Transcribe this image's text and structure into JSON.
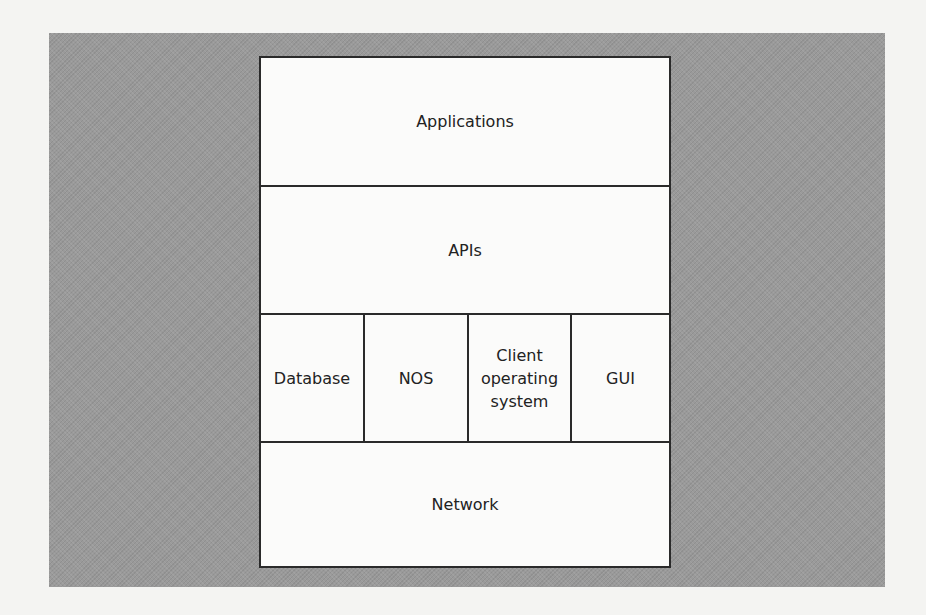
{
  "diagram": {
    "title": "",
    "layers": [
      {
        "id": "applications",
        "label": "Applications"
      },
      {
        "id": "apis",
        "label": "APIs"
      },
      {
        "id": "middle",
        "components": [
          {
            "id": "database",
            "label": "Database"
          },
          {
            "id": "nos",
            "label": "NOS"
          },
          {
            "id": "client-os",
            "label": "Client\noperating\nsystem"
          },
          {
            "id": "gui",
            "label": "GUI"
          }
        ]
      },
      {
        "id": "network",
        "label": "Network"
      }
    ],
    "colors": {
      "background": "#f4f4f2",
      "panel": "#9a9a9a",
      "box": "#fbfbfa",
      "border": "#2a2a2a",
      "text": "#222222"
    }
  }
}
